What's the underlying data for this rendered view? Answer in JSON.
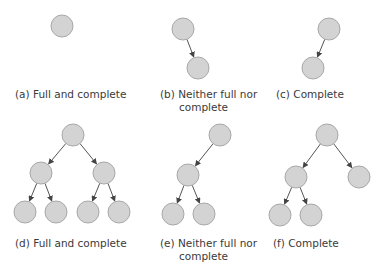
{
  "style": {
    "node_fill": "#d3d3d3",
    "node_stroke": "#a8a8a8",
    "edge_color": "#555555",
    "node_radius": 11
  },
  "panels": [
    {
      "id": "a",
      "label_line1": "(a) Full and complete",
      "label_line2": "",
      "nodes": [
        [
          62,
          26
        ]
      ],
      "edges": [],
      "label_pos": [
        15,
        88
      ]
    },
    {
      "id": "b",
      "label_line1": "(b) Neither full nor",
      "label_line2": "complete",
      "nodes": [
        [
          183,
          29
        ],
        [
          198,
          68
        ]
      ],
      "edges": [
        [
          0,
          1
        ]
      ],
      "label_pos": [
        160,
        88
      ]
    },
    {
      "id": "c",
      "label_line1": "(c) Complete",
      "label_line2": "",
      "nodes": [
        [
          329,
          29
        ],
        [
          313,
          68
        ]
      ],
      "edges": [
        [
          0,
          1
        ]
      ],
      "label_pos": [
        276,
        88
      ]
    },
    {
      "id": "d",
      "label_line1": "(d) Full and complete",
      "label_line2": "",
      "nodes": [
        [
          73,
          135
        ],
        [
          41,
          173
        ],
        [
          104,
          173
        ],
        [
          25,
          212
        ],
        [
          56,
          212
        ],
        [
          88,
          212
        ],
        [
          119,
          212
        ]
      ],
      "edges": [
        [
          0,
          1
        ],
        [
          0,
          2
        ],
        [
          1,
          3
        ],
        [
          1,
          4
        ],
        [
          2,
          5
        ],
        [
          2,
          6
        ]
      ],
      "label_pos": [
        15,
        237
      ]
    },
    {
      "id": "e",
      "label_line1": "(e) Neither full nor",
      "label_line2": "complete",
      "nodes": [
        [
          220,
          135
        ],
        [
          188,
          175
        ],
        [
          173,
          214
        ],
        [
          204,
          214
        ]
      ],
      "edges": [
        [
          0,
          1
        ],
        [
          1,
          2
        ],
        [
          1,
          3
        ]
      ],
      "label_pos": [
        160,
        237
      ]
    },
    {
      "id": "f",
      "label_line1": "(f) Complete",
      "label_line2": "",
      "nodes": [
        [
          327,
          135
        ],
        [
          296,
          177
        ],
        [
          359,
          177
        ],
        [
          280,
          215
        ],
        [
          311,
          215
        ]
      ],
      "edges": [
        [
          0,
          1
        ],
        [
          0,
          2
        ],
        [
          1,
          3
        ],
        [
          1,
          4
        ]
      ],
      "label_pos": [
        273,
        237
      ]
    }
  ]
}
